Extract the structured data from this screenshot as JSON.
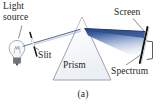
{
  "figure": {
    "panel_label": "(a)",
    "caption_subject": "Dispersion of white light into a spectrum by a prism",
    "background_color": "#ffffff",
    "width": 166,
    "height": 108
  },
  "labels": {
    "light_source_line1": "Light",
    "light_source_line2": "source",
    "slit": "Slit",
    "prism": "Prism",
    "screen": "Screen",
    "spectrum": "Spectrum"
  },
  "colors": {
    "text": "#231f20",
    "ray_line": "#3d4f7c",
    "beam_dark": "#2f4f8f",
    "beam_light": "#cdd7ea",
    "prism_fill": "#f4f6f8",
    "prism_stroke": "#9aa3ad",
    "bulb_stroke": "#9aa3ad",
    "bulb_base": "#6e7276",
    "slit_stroke": "#1c1c1c",
    "screen_stroke": "#1c1c1c",
    "bracket_stroke": "#4a4a4a",
    "leader_stroke": "#6f6f6f"
  },
  "components": {
    "bulb": {
      "name": "incandescent light bulb",
      "cx": 17,
      "cy": 48,
      "r": 7.5
    },
    "slit": {
      "name": "narrow slit aperture",
      "x1": 30,
      "y1": 33,
      "x2": 37,
      "y2": 56
    },
    "prism": {
      "name": "triangular glass prism",
      "apex_x": 82,
      "apex_y": 17,
      "left_x": 53,
      "right_x": 111,
      "base_y": 80
    },
    "screen": {
      "name": "viewing screen",
      "x1": 147,
      "y1": 28,
      "x2": 140,
      "y2": 62
    },
    "incident_ray": {
      "from": "bulb",
      "through": "slit",
      "to": "prism left face",
      "description": "single white light ray"
    },
    "dispersed_beam": {
      "from": "prism right face",
      "to": "screen",
      "description": "fan of refracted light spreading into a spectrum"
    },
    "spectrum_bracket": {
      "name": "bracket marking spectrum band on screen",
      "top_y": 42,
      "bottom_y": 61
    }
  }
}
